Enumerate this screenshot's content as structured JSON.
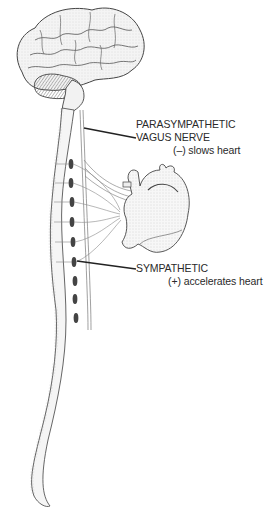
{
  "diagram": {
    "parts": [
      "brain",
      "spinal-cord",
      "vagus-nerve",
      "sympathetic-ganglia",
      "heart"
    ],
    "labels": {
      "parasympathetic": {
        "line1": "PARASYMPATHETIC",
        "line2": "VAGUS NERVE",
        "effect": "(–)  slows heart"
      },
      "sympathetic": {
        "line1": "SYMPATHETIC",
        "effect": "(+)  accelerates heart"
      }
    },
    "colors": {
      "ink": "#2a2a2a",
      "shading": "#8a8a8a",
      "background": "#ffffff"
    }
  }
}
